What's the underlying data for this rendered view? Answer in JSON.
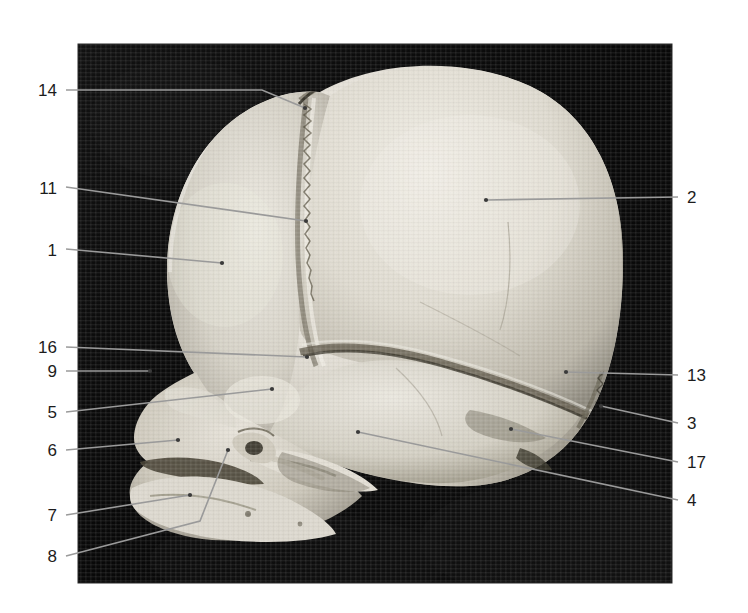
{
  "figure": {
    "type": "anatomical-photograph",
    "background_color": "#ffffff",
    "photo": {
      "x": 78,
      "y": 44,
      "width": 594,
      "height": 539,
      "background_color": "#0a0a0a",
      "specimen_color": "#d9d6cf"
    },
    "leader_line_color": "#9a9a9a",
    "label_color": "#1c1c1c"
  },
  "labels": [
    {
      "id": "label-14",
      "text": "14",
      "side": "left",
      "text_x": 57,
      "text_y": 96,
      "path": "M 66,90 L 262,90 L 305,108",
      "dot_x": 305,
      "dot_y": 108
    },
    {
      "id": "label-11",
      "text": "11",
      "side": "left",
      "text_x": 57,
      "text_y": 194,
      "path": "M 66,187 L 306,221",
      "dot_x": 306,
      "dot_y": 221
    },
    {
      "id": "label-1",
      "text": "1",
      "side": "left",
      "text_x": 57,
      "text_y": 256,
      "path": "M 66,249 L 222,263",
      "dot_x": 222,
      "dot_y": 263
    },
    {
      "id": "label-16",
      "text": "16",
      "side": "left",
      "text_x": 57,
      "text_y": 353,
      "path": "M 66,347 L 307,357",
      "dot_x": 307,
      "dot_y": 357
    },
    {
      "id": "label-9",
      "text": "9",
      "side": "left",
      "text_x": 57,
      "text_y": 377,
      "path": "M 66,371 L 150,371",
      "dot_x": 150,
      "dot_y": 371
    },
    {
      "id": "label-5",
      "text": "5",
      "side": "left",
      "text_x": 57,
      "text_y": 418,
      "path": "M 66,412 L 272,389",
      "dot_x": 272,
      "dot_y": 389
    },
    {
      "id": "label-6",
      "text": "6",
      "side": "left",
      "text_x": 57,
      "text_y": 456,
      "path": "M 66,450 L 178,440",
      "dot_x": 178,
      "dot_y": 440
    },
    {
      "id": "label-7",
      "text": "7",
      "side": "left",
      "text_x": 57,
      "text_y": 521,
      "path": "M 66,515 L 190,495",
      "dot_x": 190,
      "dot_y": 495
    },
    {
      "id": "label-8",
      "text": "8",
      "side": "left",
      "text_x": 57,
      "text_y": 562,
      "path": "M 66,556 L 200,521 L 228,450",
      "dot_x": 228,
      "dot_y": 450
    },
    {
      "id": "label-2",
      "text": "2",
      "side": "right",
      "text_x": 687,
      "text_y": 203,
      "path": "M 678,197 L 486,200",
      "dot_x": 486,
      "dot_y": 200
    },
    {
      "id": "label-13",
      "text": "13",
      "side": "right",
      "text_x": 687,
      "text_y": 381,
      "path": "M 678,375 L 566,372",
      "dot_x": 566,
      "dot_y": 372
    },
    {
      "id": "label-3",
      "text": "3",
      "side": "right",
      "text_x": 687,
      "text_y": 429,
      "path": "M 678,423 L 601,406",
      "dot_x": 601,
      "dot_y": 406
    },
    {
      "id": "label-17",
      "text": "17",
      "side": "right",
      "text_x": 687,
      "text_y": 468,
      "path": "M 678,462 L 511,429",
      "dot_x": 511,
      "dot_y": 429
    },
    {
      "id": "label-4",
      "text": "4",
      "side": "right",
      "text_x": 687,
      "text_y": 506,
      "path": "M 678,500 L 358,432",
      "dot_x": 358,
      "dot_y": 432
    }
  ]
}
